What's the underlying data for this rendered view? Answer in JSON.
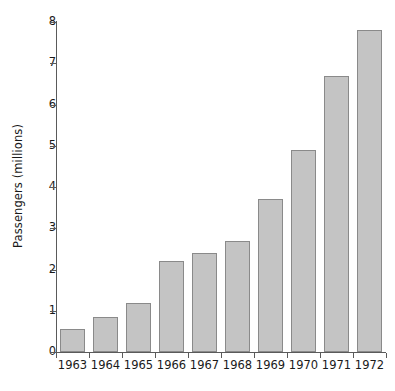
{
  "chart_data": {
    "type": "bar",
    "title": "",
    "xlabel": "",
    "ylabel": "Passengers (millions)",
    "categories": [
      "1963",
      "1964",
      "1965",
      "1966",
      "1967",
      "1968",
      "1969",
      "1970",
      "1971",
      "1972"
    ],
    "values": [
      0.55,
      0.85,
      1.2,
      2.2,
      2.4,
      2.7,
      3.7,
      4.9,
      6.7,
      7.8
    ],
    "ylim": [
      0,
      8
    ],
    "ytick_labels": [
      "0",
      "1",
      "2",
      "3",
      "4",
      "5",
      "6",
      "7",
      "8"
    ],
    "ytick_values": [
      0,
      1,
      2,
      3,
      4,
      5,
      6,
      7,
      8
    ],
    "grid": false,
    "legend": null,
    "series": [
      {
        "name": "Passengers",
        "values": [
          0.55,
          0.85,
          1.2,
          2.2,
          2.4,
          2.7,
          3.7,
          4.9,
          6.7,
          7.8
        ]
      }
    ],
    "colors": {
      "bar_fill": "#c4c4c4",
      "bar_border": "#8a8a8a",
      "axis": "#5a5a5a",
      "text": "#1a1a1a",
      "background": "#ffffff"
    }
  }
}
